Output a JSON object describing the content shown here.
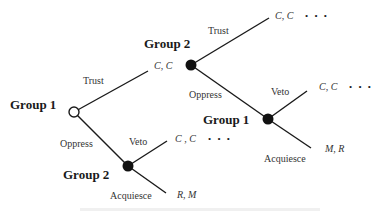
{
  "diagram": {
    "type": "game-tree",
    "nodes": [
      {
        "id": "root",
        "player": "Group 1",
        "style": "open"
      },
      {
        "id": "g2-lower",
        "player": "Group 2",
        "style": "filled"
      },
      {
        "id": "g2-upper",
        "player": "Group 2",
        "style": "filled"
      },
      {
        "id": "g1-inner",
        "player": "Group 1",
        "style": "filled"
      }
    ],
    "labels": {
      "root_player": "Group 1",
      "upper_player": "Group 2",
      "lower_player": "Group 2",
      "inner_player": "Group 1",
      "root_trust": "Trust",
      "root_oppress": "Oppress",
      "lower_veto": "Veto",
      "lower_acquiesce": "Acquiesce",
      "upper_trust": "Trust",
      "upper_oppress": "Oppress",
      "inner_veto": "Veto",
      "inner_acquiesce": "Acquiesce"
    },
    "payoffs": {
      "root_trust": "C, C",
      "lower_veto": "C , C",
      "lower_acquiesce": "R, M",
      "upper_trust": "C, C",
      "inner_veto": "C, C",
      "inner_acquiesce": "M, R"
    },
    "continuation": "• • •",
    "caption": ""
  }
}
